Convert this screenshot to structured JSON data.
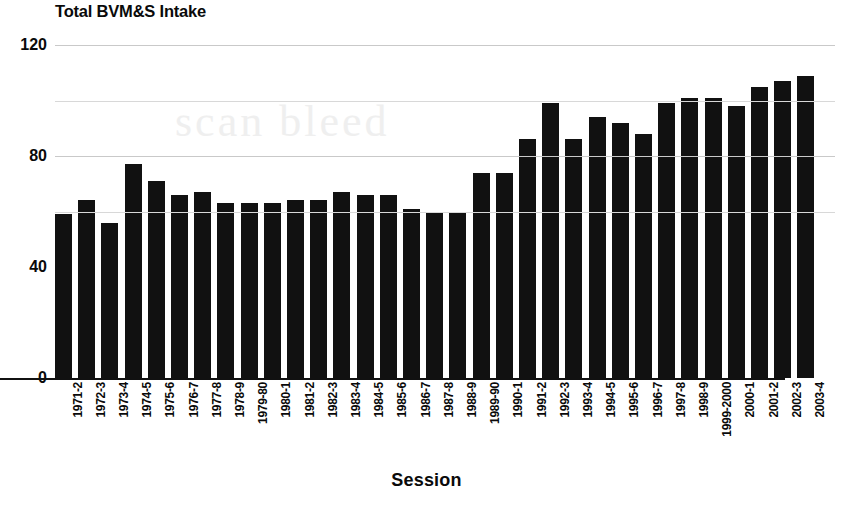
{
  "chart_data": {
    "type": "bar",
    "title": "Total BVM&S Intake",
    "xlabel": "Session",
    "ylabel": "",
    "ylim": [
      0,
      120
    ],
    "yticks": [
      0,
      40,
      80,
      120
    ],
    "ytick_labels": [
      "0",
      "40",
      "80",
      "120"
    ],
    "gridlines": [
      60,
      80,
      100,
      120
    ],
    "grid": true,
    "legend": null,
    "bar_color": "#111111",
    "categories": [
      "1971-2",
      "1972-3",
      "1973-4",
      "1974-5",
      "1975-6",
      "1976-7",
      "1977-8",
      "1978-9",
      "1979-80",
      "1980-1",
      "1981-2",
      "1982-3",
      "1983-4",
      "1984-5",
      "1985-6",
      "1986-7",
      "1987-8",
      "1988-9",
      "1989-90",
      "1990-1",
      "1991-2",
      "1992-3",
      "1993-4",
      "1994-5",
      "1995-6",
      "1996-7",
      "1997-8",
      "1998-9",
      "1999-2000",
      "2000-1",
      "2001-2",
      "2002-3",
      "2003-4"
    ],
    "values": [
      59,
      64,
      56,
      77,
      71,
      66,
      67,
      63,
      63,
      63,
      64,
      64,
      67,
      66,
      66,
      61,
      60,
      60,
      74,
      74,
      86,
      99,
      86,
      94,
      92,
      88,
      99,
      101,
      101,
      98,
      105,
      107,
      109
    ]
  },
  "artifact": {
    "watermark_text": "scan bleed"
  }
}
